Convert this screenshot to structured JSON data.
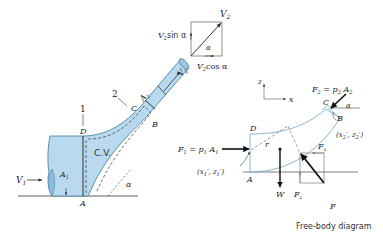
{
  "colors": {
    "fluid_fill": "#b9d9ee",
    "fluid_stroke": "#4a86ad",
    "line": "#333333",
    "cv_outline": "#7ab0d0"
  },
  "left": {
    "section1": "1",
    "section2": "2",
    "D": "D",
    "A": "A",
    "C": "C",
    "B": "B",
    "V1": "V",
    "V1_sub": "1",
    "A1": "A",
    "A1_sub": "1",
    "A2": "A",
    "A2_sub": "2",
    "V2": "V",
    "V2_sub": "2",
    "cv": "C.V.",
    "alpha": "α"
  },
  "vector": {
    "V2": "V",
    "V2_sub": "2",
    "sin_label": "sin α",
    "cos_label": "cos α",
    "V": "V",
    "sub": "2",
    "alpha": "α"
  },
  "fbd": {
    "axis_z": "z",
    "axis_x": "x",
    "F2": "F",
    "F2_sub": "2",
    "F2_eq": " = p",
    "p2_sub": "2",
    "A2": " A",
    "A2_sub": "2",
    "F1": "F",
    "F1_sub": "1",
    "F1_eq": " = p",
    "p1_sub": "1",
    "A1": " A",
    "A1_sub": "1",
    "C": "C",
    "B": "B",
    "D": "D",
    "A": "A",
    "r": "r",
    "alpha": "α",
    "pt2": "(x",
    "pt2_mid": "′, z",
    "pt2_end": "′)",
    "pt1": "(x",
    "pt1_mid": "′, z",
    "pt1_end": "′)",
    "sub2": "2",
    "sub1": "1",
    "W": "W",
    "Fx": "F",
    "Fx_sub": "x",
    "Fz": "F",
    "Fz_sub": "z",
    "F": "F",
    "caption": "Free-body diagram"
  }
}
